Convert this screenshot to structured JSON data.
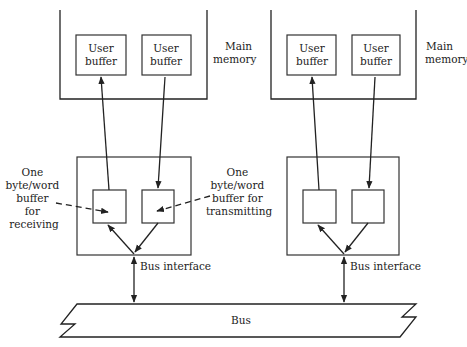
{
  "diagram": {
    "left_node": {
      "memory_label_line1": "Main",
      "memory_label_line2": "memory",
      "user_buffer_1": {
        "line1": "User",
        "line2": "buffer"
      },
      "user_buffer_2": {
        "line1": "User",
        "line2": "buffer"
      },
      "receive_annotation": [
        "One",
        "byte/word",
        "buffer",
        "for",
        "receiving"
      ],
      "transmit_annotation": [
        "One",
        "byte/word",
        "buffer for",
        "transmitting"
      ],
      "bus_interface_label": "Bus interface"
    },
    "right_node": {
      "memory_label_line1": "Main",
      "memory_label_line2": "memory",
      "user_buffer_1": {
        "line1": "User",
        "line2": "buffer"
      },
      "user_buffer_2": {
        "line1": "User",
        "line2": "buffer"
      },
      "bus_interface_label": "Bus interface"
    },
    "bus_label": "Bus"
  }
}
